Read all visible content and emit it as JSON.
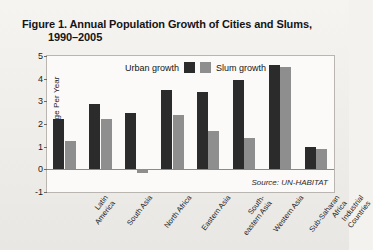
{
  "figure": {
    "title_line1": "Figure 1. Annual Population Growth of Cities and Slums,",
    "title_line2": "1990–2005",
    "source": "Source: UN-HABITAT"
  },
  "chart_data": {
    "type": "bar",
    "title": "Figure 1. Annual Population Growth of Cities and Slums, 1990–2005",
    "xlabel": "",
    "ylabel": "Percent Change Per Year",
    "ylim": [
      -1,
      5
    ],
    "yticks": [
      -1,
      0,
      1,
      2,
      3,
      4,
      5
    ],
    "ytick_labels": [
      "-1",
      "0",
      "1",
      "2",
      "3",
      "4",
      "5"
    ],
    "grid": false,
    "legend_position": "top-center",
    "categories": [
      "Latin America",
      "South Asia",
      "North Africa",
      "Eastern Asia",
      "South-eastern Asia",
      "Western Asia",
      "Sub-Saharan Africa",
      "Industrial Countries"
    ],
    "category_lines": [
      [
        "Latin",
        "America"
      ],
      [
        "South Asia"
      ],
      [
        "North Africa"
      ],
      [
        "Eastern Asia"
      ],
      [
        "South-",
        "eastern Asia"
      ],
      [
        "Western Asia"
      ],
      [
        "Sub-Saharan",
        "Africa"
      ],
      [
        "Industrial",
        "Countries"
      ]
    ],
    "series": [
      {
        "name": "Urban growth",
        "color": "#2b2b2b",
        "values": [
          2.2,
          2.9,
          2.5,
          3.5,
          3.4,
          3.95,
          4.6,
          1.0
        ]
      },
      {
        "name": "Slum growth",
        "color": "#8e8e8e",
        "values": [
          1.25,
          2.2,
          -0.15,
          2.4,
          1.7,
          1.4,
          4.5,
          0.9
        ]
      }
    ],
    "annotations": [
      "Source: UN-HABITAT"
    ]
  }
}
